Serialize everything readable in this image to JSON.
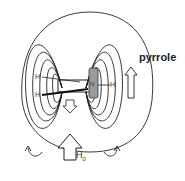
{
  "diagram": {
    "molecule_label": "pyrrole",
    "applied_field": {
      "symbol": "H",
      "subscript": "0"
    },
    "atom_labels": {
      "h_left_top": "H",
      "h_left_bottom": "H",
      "h_right": "H",
      "n_ring": "N"
    },
    "colors": {
      "line": "#222222",
      "ring": "#999999",
      "background": "#ffffff"
    }
  }
}
